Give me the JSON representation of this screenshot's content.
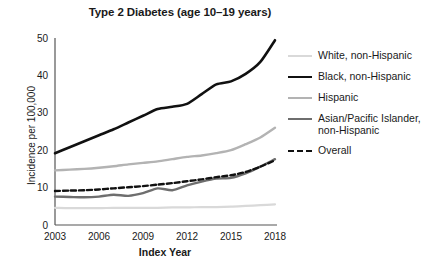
{
  "chart_data": {
    "type": "line",
    "title": "Type 2 Diabetes (age 10–19 years)",
    "xlabel": "Index Year",
    "ylabel": "Incidence per 100,000",
    "xlim": [
      2003,
      2018
    ],
    "ylim": [
      0,
      50
    ],
    "xticks": [
      "2003",
      "2006",
      "2009",
      "2012",
      "2015",
      "2018"
    ],
    "xtick_values": [
      2003,
      2006,
      2009,
      2012,
      2015,
      2018
    ],
    "yticks": [
      "0",
      "10",
      "20",
      "30",
      "40",
      "50"
    ],
    "ytick_values": [
      0,
      10,
      20,
      30,
      40,
      50
    ],
    "grid": false,
    "legend_position": "right",
    "x": [
      2003,
      2004,
      2005,
      2006,
      2007,
      2008,
      2009,
      2010,
      2011,
      2012,
      2013,
      2014,
      2015,
      2016,
      2017,
      2018
    ],
    "series": [
      {
        "name": "White, non-Hispanic",
        "color": "#d9d9d9",
        "width": 2.2,
        "dash": "none",
        "values": [
          4.6,
          4.5,
          4.5,
          4.5,
          4.6,
          4.6,
          4.6,
          4.6,
          4.7,
          4.7,
          4.8,
          4.8,
          4.9,
          5.1,
          5.3,
          5.5
        ]
      },
      {
        "name": "Black, non-Hispanic",
        "color": "#111111",
        "width": 2.6,
        "dash": "none",
        "values": [
          19.2,
          20.8,
          22.4,
          24.0,
          25.6,
          27.4,
          29.2,
          31.0,
          31.6,
          32.4,
          35.0,
          37.6,
          38.4,
          40.4,
          43.6,
          49.4
        ]
      },
      {
        "name": "Hispanic",
        "color": "#b3b3b3",
        "width": 2.4,
        "dash": "none",
        "values": [
          14.6,
          14.8,
          15.0,
          15.3,
          15.7,
          16.2,
          16.6,
          17.0,
          17.6,
          18.2,
          18.6,
          19.2,
          20.0,
          21.6,
          23.4,
          26.0
        ]
      },
      {
        "name": "Asian/Pacific Islander, non-Hispanic",
        "color": "#6e6e6e",
        "width": 2.4,
        "dash": "none",
        "values": [
          7.6,
          7.5,
          7.4,
          7.6,
          8.1,
          7.8,
          8.5,
          9.8,
          9.3,
          10.6,
          11.6,
          12.4,
          12.6,
          13.8,
          15.6,
          17.6
        ]
      },
      {
        "name": "Overall",
        "color": "#111111",
        "width": 2.4,
        "dash": "5,3",
        "values": [
          9.1,
          9.2,
          9.3,
          9.5,
          9.8,
          10.1,
          10.4,
          10.8,
          11.2,
          11.7,
          12.2,
          12.8,
          13.3,
          14.2,
          15.6,
          17.3
        ]
      }
    ]
  }
}
